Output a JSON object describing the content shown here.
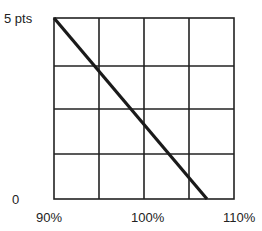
{
  "chart_data": {
    "type": "line",
    "title": "",
    "xlabel": "",
    "ylabel": "",
    "x_ticks": [
      "90%",
      "100%",
      "110%"
    ],
    "y_ticks": [
      "0",
      "5 pts"
    ],
    "xlim": [
      90,
      110
    ],
    "ylim": [
      0,
      5
    ],
    "grid": true,
    "grid_divisions": {
      "x": 4,
      "y": 4
    },
    "series": [
      {
        "name": "",
        "x": [
          90,
          107
        ],
        "y": [
          5,
          0
        ]
      }
    ]
  },
  "labels": {
    "y_top": "5 pts",
    "y_bottom": "0",
    "x_left": "90%",
    "x_mid": "100%",
    "x_right": "110%"
  },
  "colors": {
    "grid": "#222222",
    "line": "#1a1a1a"
  }
}
